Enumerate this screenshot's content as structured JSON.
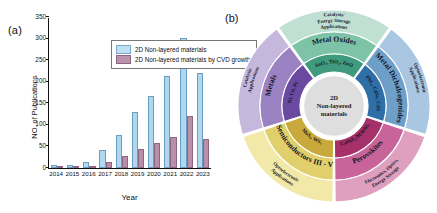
{
  "figure": {
    "panel_a_label": "(a)",
    "panel_b_label": "(b)"
  },
  "chart_data": {
    "type": "bar",
    "title": "",
    "xlabel": "Year",
    "ylabel": "NO. of Publications",
    "categories": [
      "2014",
      "2015",
      "2016",
      "2017",
      "2018",
      "2019",
      "2020",
      "2021",
      "2022",
      "2023"
    ],
    "ylim": [
      0,
      350
    ],
    "yticks": [
      0,
      50,
      100,
      150,
      200,
      250,
      300,
      350
    ],
    "grid": false,
    "legend_position": "top-left",
    "series": [
      {
        "name": "2D Non-layered materials",
        "color": "#afd7ef",
        "values": [
          7,
          7,
          13,
          42,
          77,
          130,
          166,
          213,
          302,
          220
        ]
      },
      {
        "name": "2D Non-layered materials by CVD growth",
        "color": "#b98ea8",
        "values": [
          2,
          2,
          2,
          13,
          27,
          45,
          57,
          71,
          121,
          68
        ]
      }
    ]
  },
  "wheel": {
    "center_line1": "2D",
    "center_line2": "Non-layered",
    "center_line3": "materials",
    "sectors": [
      {
        "id": "metal-oxides",
        "category": "Metal Oxides",
        "compounds": "SnO₂, TiO₂, ZnO",
        "applications": "Catalysis/ Energy Storage Applications",
        "app_line1": "Catalysis/",
        "app_line2": "Energy Storage",
        "app_line3": "Applications",
        "color_inner": "#3f9a7e",
        "color_mid": "#7dc3a8",
        "color_outer": "#bfe0d2"
      },
      {
        "id": "metal-dichalcogenides",
        "category": "Metal Dichalcogenides",
        "compounds": "PbI₂, CdSe, CdS",
        "applications": "Optoelectronic Applications",
        "app_line1": "Optoelectronic",
        "app_line2": "Applications",
        "color_inner": "#2f6fa8",
        "color_mid": "#6d9fc9",
        "color_outer": "#a9c6e2"
      },
      {
        "id": "perovskites",
        "category": "Perovskites",
        "compounds": "CsPbX₃/MAPbI₃",
        "applications": "Electronics, Optics, Energy Storage",
        "app_line1": "Electronics, Optics,",
        "app_line2": "Energy Storage",
        "color_inner": "#a5306a",
        "color_mid": "#c9649a",
        "color_outer": "#dfa0bf"
      },
      {
        "id": "semiconductors",
        "category": "Semiconductors III - V",
        "compounds": "MoS₂, WS₂",
        "applications": "Optoelectronic Applications",
        "app_line1": "Optoelectronic",
        "app_line2": "Applications",
        "color_inner": "#c9a83c",
        "color_mid": "#e0cf6b",
        "color_outer": "#f2e9a8"
      },
      {
        "id": "metals",
        "category": "Metals",
        "compounds": "Ni, Cu, Pt",
        "applications": "Catalysis Applications",
        "app_line1": "Catalysis",
        "app_line2": "Applications",
        "color_inner": "#6a49a0",
        "color_mid": "#9b82c2",
        "color_outer": "#c6b8dd"
      }
    ]
  }
}
